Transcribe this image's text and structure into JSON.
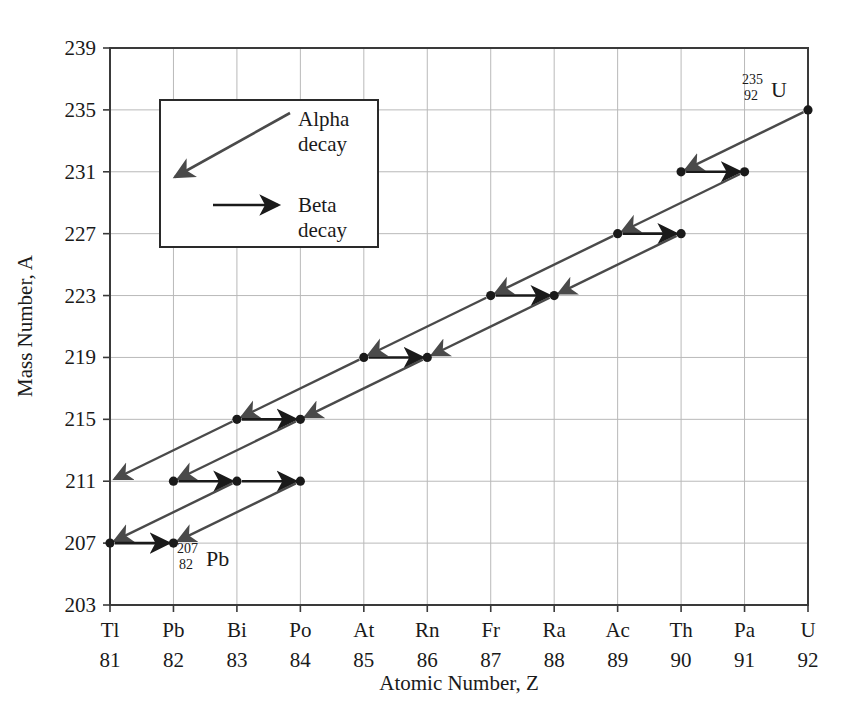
{
  "figure": {
    "title": "",
    "xlabel": "Atomic Number, Z",
    "ylabel": "Mass Number, A"
  },
  "legend": {
    "alpha_line1": "Alpha",
    "alpha_line2": "decay",
    "beta_line1": "Beta",
    "beta_line2": "decay"
  },
  "annotations": {
    "start": {
      "mass": "235",
      "atomic": "92",
      "symbol": "U"
    },
    "end": {
      "mass": "207",
      "atomic": "82",
      "symbol": "Pb"
    }
  },
  "colors": {
    "alpha_arrow": "#4a4a4a",
    "beta_arrow": "#1a1a1a",
    "grid": "#b9b9b9",
    "frame": "#3a3a3a",
    "point": "#1a1a1a",
    "background": "#ffffff"
  },
  "chart_data": {
    "type": "scatter",
    "title": "",
    "xlabel": "Atomic Number, Z",
    "ylabel": "Mass Number, A",
    "xlim": [
      81,
      92
    ],
    "ylim": [
      203,
      239
    ],
    "grid": true,
    "legend_position": "upper-left-inset",
    "x_tick_symbols": [
      "Tl",
      "Pb",
      "Bi",
      "Po",
      "At",
      "Rn",
      "Fr",
      "Ra",
      "Ac",
      "Th",
      "Pa",
      "U"
    ],
    "x_tick_numbers": [
      "81",
      "82",
      "83",
      "84",
      "85",
      "86",
      "87",
      "88",
      "89",
      "90",
      "91",
      "92"
    ],
    "y_ticks": [
      "203",
      "207",
      "211",
      "215",
      "219",
      "223",
      "227",
      "231",
      "235",
      "239"
    ],
    "nodes": [
      {
        "symbol": "U",
        "Z": 92,
        "A": 235
      },
      {
        "symbol": "Th",
        "Z": 90,
        "A": 231
      },
      {
        "symbol": "Pa",
        "Z": 91,
        "A": 231
      },
      {
        "symbol": "Ac",
        "Z": 89,
        "A": 227
      },
      {
        "symbol": "Th",
        "Z": 90,
        "A": 227
      },
      {
        "symbol": "Fr",
        "Z": 87,
        "A": 223
      },
      {
        "symbol": "Ra",
        "Z": 88,
        "A": 223
      },
      {
        "symbol": "At",
        "Z": 85,
        "A": 219
      },
      {
        "symbol": "Rn",
        "Z": 86,
        "A": 219
      },
      {
        "symbol": "Bi",
        "Z": 83,
        "A": 215
      },
      {
        "symbol": "Po",
        "Z": 84,
        "A": 215
      },
      {
        "symbol": "Pb",
        "Z": 82,
        "A": 211
      },
      {
        "symbol": "Bi",
        "Z": 83,
        "A": 211
      },
      {
        "symbol": "Po",
        "Z": 84,
        "A": 211
      },
      {
        "symbol": "Tl",
        "Z": 81,
        "A": 207
      },
      {
        "symbol": "Pb",
        "Z": 82,
        "A": 207
      }
    ],
    "transitions": [
      {
        "kind": "alpha",
        "from": {
          "Z": 92,
          "A": 235
        },
        "to": {
          "Z": 90,
          "A": 231
        }
      },
      {
        "kind": "beta",
        "from": {
          "Z": 90,
          "A": 231
        },
        "to": {
          "Z": 91,
          "A": 231
        }
      },
      {
        "kind": "alpha",
        "from": {
          "Z": 91,
          "A": 231
        },
        "to": {
          "Z": 89,
          "A": 227
        }
      },
      {
        "kind": "beta",
        "from": {
          "Z": 89,
          "A": 227
        },
        "to": {
          "Z": 90,
          "A": 227
        }
      },
      {
        "kind": "alpha",
        "from": {
          "Z": 89,
          "A": 227
        },
        "to": {
          "Z": 87,
          "A": 223
        }
      },
      {
        "kind": "alpha",
        "from": {
          "Z": 90,
          "A": 227
        },
        "to": {
          "Z": 88,
          "A": 223
        }
      },
      {
        "kind": "beta",
        "from": {
          "Z": 87,
          "A": 223
        },
        "to": {
          "Z": 88,
          "A": 223
        }
      },
      {
        "kind": "alpha",
        "from": {
          "Z": 87,
          "A": 223
        },
        "to": {
          "Z": 85,
          "A": 219
        }
      },
      {
        "kind": "alpha",
        "from": {
          "Z": 88,
          "A": 223
        },
        "to": {
          "Z": 86,
          "A": 219
        }
      },
      {
        "kind": "beta",
        "from": {
          "Z": 85,
          "A": 219
        },
        "to": {
          "Z": 86,
          "A": 219
        }
      },
      {
        "kind": "alpha",
        "from": {
          "Z": 85,
          "A": 219
        },
        "to": {
          "Z": 83,
          "A": 215
        }
      },
      {
        "kind": "alpha",
        "from": {
          "Z": 86,
          "A": 219
        },
        "to": {
          "Z": 84,
          "A": 215
        }
      },
      {
        "kind": "beta",
        "from": {
          "Z": 83,
          "A": 215
        },
        "to": {
          "Z": 84,
          "A": 215
        }
      },
      {
        "kind": "alpha",
        "from": {
          "Z": 83,
          "A": 215
        },
        "to": {
          "Z": 81,
          "A": 211
        }
      },
      {
        "kind": "alpha",
        "from": {
          "Z": 84,
          "A": 215
        },
        "to": {
          "Z": 82,
          "A": 211
        }
      },
      {
        "kind": "beta",
        "from": {
          "Z": 82,
          "A": 211
        },
        "to": {
          "Z": 83,
          "A": 211
        }
      },
      {
        "kind": "beta",
        "from": {
          "Z": 83,
          "A": 211
        },
        "to": {
          "Z": 84,
          "A": 211
        }
      },
      {
        "kind": "alpha",
        "from": {
          "Z": 83,
          "A": 211
        },
        "to": {
          "Z": 81,
          "A": 207
        }
      },
      {
        "kind": "alpha",
        "from": {
          "Z": 84,
          "A": 211
        },
        "to": {
          "Z": 82,
          "A": 207
        }
      },
      {
        "kind": "beta",
        "from": {
          "Z": 81,
          "A": 207
        },
        "to": {
          "Z": 82,
          "A": 207
        }
      }
    ]
  }
}
